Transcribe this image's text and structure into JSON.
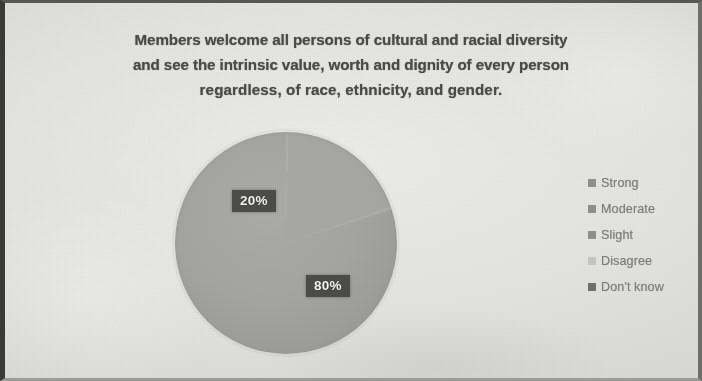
{
  "figure": {
    "title_lines": [
      "Members welcome all persons of cultural and racial diversity",
      "and see the intrinsic value, worth and dignity of every person",
      "regardless, of race, ethnicity, and gender."
    ],
    "title_full": "Members welcome all persons of cultural and racial diversity and see the intrinsic value, worth and dignity of every person regardless, of race, ethnicity, and gender.",
    "background_color": "#e4e4e2",
    "title_color": "#4a4a48",
    "frame_color": "#3a3a38"
  },
  "chart_data": {
    "type": "pie",
    "title": "Members welcome all persons of cultural and racial diversity and see the intrinsic value, worth and dignity of every person regardless, of race, ethnicity, and gender.",
    "xlabel": "",
    "ylabel": "",
    "grid": false,
    "legend_position": "right",
    "categories": [
      "Strong",
      "Moderate",
      "Slight",
      "Disagree",
      "Don't know"
    ],
    "values": [
      80,
      20,
      0,
      0,
      0
    ],
    "value_labels": [
      "80%",
      "20%",
      "",
      "",
      ""
    ],
    "visible_slice_labels": [
      "20%",
      "80%"
    ],
    "slice_colors": [
      "#a6a6a4",
      "#a9a9a7",
      "#9e9e9c",
      "#cfcfcd",
      "#8f8f8d"
    ],
    "units": "percent",
    "total": 100,
    "series": [
      {
        "name": "Response distribution",
        "values": [
          80,
          20,
          0,
          0,
          0
        ]
      }
    ]
  },
  "labels": {
    "minority": "20%",
    "majority": "80%",
    "label_text_color": "#f2f2f0",
    "label_box_color": "#4b4b49"
  },
  "legend": {
    "items": [
      {
        "label": "Strong",
        "swatch_color": "#8e8e8c"
      },
      {
        "label": "Moderate",
        "swatch_color": "#8e8e8c"
      },
      {
        "label": "Slight",
        "swatch_color": "#8e8e8c"
      },
      {
        "label": "Disagree",
        "swatch_color": "#c4c4c2"
      },
      {
        "label": "Don't know",
        "swatch_color": "#6f6f6d"
      }
    ],
    "text_color": "#7d7d7b"
  }
}
